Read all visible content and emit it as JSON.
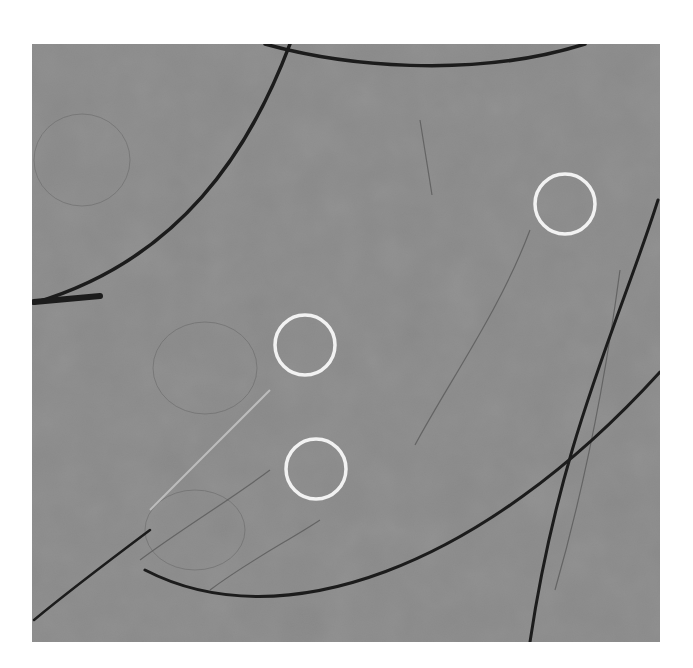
{
  "image": {
    "kind": "grayscale micrograph",
    "background_color": "#ffffff",
    "field_color": "#8c8c8c",
    "fiber_color": "#1e1e1e",
    "highlight_circle_color": "#f2f2f2",
    "highlight_circles": [
      {
        "cx": 565,
        "cy": 204,
        "r": 30
      },
      {
        "cx": 305,
        "cy": 345,
        "r": 30
      },
      {
        "cx": 316,
        "cy": 469,
        "r": 30
      }
    ]
  }
}
